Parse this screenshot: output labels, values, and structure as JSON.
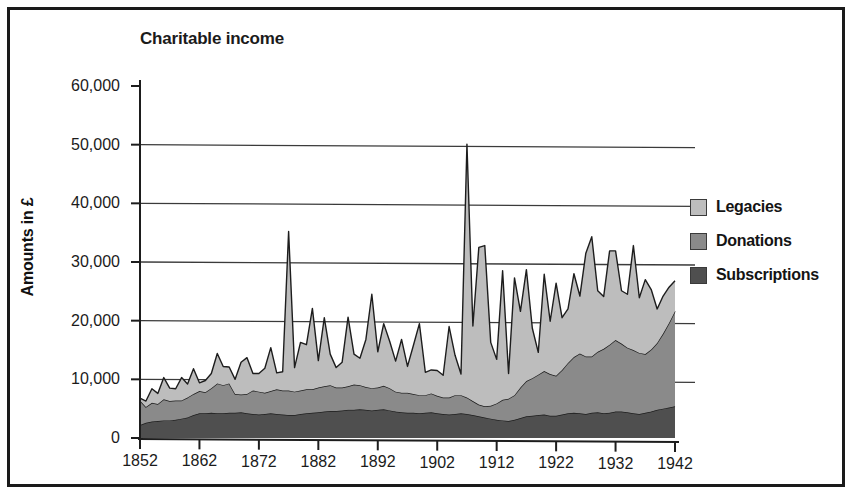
{
  "figure": {
    "title": "Charitable income",
    "frame_color": "#1a1a1a",
    "background": "#ffffff"
  },
  "legend": {
    "position": "right",
    "items": [
      {
        "label": "Legacies",
        "color": "#bdbdbd",
        "swatch_name": "legend-swatch-legacies"
      },
      {
        "label": "Donations",
        "color": "#8a8a8a",
        "swatch_name": "legend-swatch-donations"
      },
      {
        "label": "Subscriptions",
        "color": "#4f4f4f",
        "swatch_name": "legend-swatch-subscriptions"
      }
    ]
  },
  "chart_data": {
    "type": "area",
    "stacked": true,
    "title": "Charitable income",
    "xlabel": "",
    "ylabel": "Amounts in £",
    "xlim": [
      1852,
      1942
    ],
    "ylim": [
      0,
      60000
    ],
    "grid": true,
    "gridlines_y": [
      10000,
      20000,
      30000,
      40000,
      50000
    ],
    "ytick_labels": [
      "0",
      "10,000",
      "20,000",
      "30,000",
      "40,000",
      "50,000",
      "60,000"
    ],
    "ytick_values": [
      0,
      10000,
      20000,
      30000,
      40000,
      50000,
      60000
    ],
    "xtick_labels": [
      "1852",
      "1862",
      "1872",
      "1882",
      "1892",
      "1902",
      "1912",
      "1922",
      "1932",
      "1942"
    ],
    "xtick_values": [
      1852,
      1862,
      1872,
      1882,
      1892,
      1902,
      1912,
      1922,
      1932,
      1942
    ],
    "x": [
      1852,
      1853,
      1854,
      1855,
      1856,
      1857,
      1858,
      1859,
      1860,
      1861,
      1862,
      1863,
      1864,
      1865,
      1866,
      1867,
      1868,
      1869,
      1870,
      1871,
      1872,
      1873,
      1874,
      1875,
      1876,
      1877,
      1878,
      1879,
      1880,
      1881,
      1882,
      1883,
      1884,
      1885,
      1886,
      1887,
      1888,
      1889,
      1890,
      1891,
      1892,
      1893,
      1894,
      1895,
      1896,
      1897,
      1898,
      1899,
      1900,
      1901,
      1902,
      1903,
      1904,
      1905,
      1906,
      1907,
      1908,
      1909,
      1910,
      1911,
      1912,
      1913,
      1914,
      1915,
      1916,
      1917,
      1918,
      1919,
      1920,
      1921,
      1922,
      1923,
      1924,
      1925,
      1926,
      1927,
      1928,
      1929,
      1930,
      1931,
      1932,
      1933,
      1934,
      1935,
      1936,
      1937,
      1938,
      1939,
      1940,
      1941,
      1942
    ],
    "series": [
      {
        "name": "Subscriptions",
        "color": "#4f4f4f",
        "values": [
          2200,
          2600,
          2800,
          2900,
          3000,
          3000,
          3100,
          3300,
          3500,
          3900,
          4200,
          4200,
          4300,
          4200,
          4200,
          4300,
          4300,
          4400,
          4200,
          4100,
          4000,
          4100,
          4200,
          4100,
          4000,
          3900,
          3900,
          4100,
          4200,
          4300,
          4400,
          4500,
          4600,
          4600,
          4700,
          4800,
          4800,
          4900,
          4800,
          4700,
          4800,
          4900,
          4700,
          4500,
          4400,
          4300,
          4300,
          4200,
          4300,
          4400,
          4200,
          4100,
          4000,
          4100,
          4200,
          4100,
          3900,
          3700,
          3500,
          3300,
          3100,
          3000,
          2900,
          3100,
          3400,
          3700,
          3800,
          3900,
          4000,
          3800,
          3800,
          4000,
          4200,
          4300,
          4200,
          4100,
          4300,
          4400,
          4200,
          4300,
          4500,
          4500,
          4400,
          4200,
          4100,
          4300,
          4500,
          4800,
          5000,
          5200,
          5400
        ]
      },
      {
        "name": "Donations",
        "color": "#8a8a8a",
        "values": [
          4200,
          2700,
          3200,
          2900,
          3600,
          3300,
          3300,
          3100,
          3400,
          3600,
          3800,
          3600,
          4200,
          5100,
          4800,
          5000,
          3200,
          3000,
          3300,
          4000,
          3900,
          3600,
          3800,
          4200,
          4100,
          4200,
          4000,
          4000,
          4100,
          4000,
          4200,
          4300,
          4400,
          4000,
          3900,
          4000,
          4300,
          4100,
          3900,
          3800,
          3800,
          4000,
          3800,
          3400,
          3300,
          3400,
          3200,
          3100,
          3000,
          3200,
          3000,
          2800,
          2900,
          3200,
          3100,
          2800,
          2400,
          2000,
          1900,
          2200,
          2800,
          3500,
          3800,
          4200,
          5200,
          6000,
          6400,
          6900,
          7400,
          7100,
          6800,
          7600,
          8600,
          9500,
          10200,
          9800,
          9600,
          10300,
          11000,
          11600,
          12200,
          11600,
          11000,
          10800,
          10400,
          10000,
          10600,
          11400,
          12800,
          14400,
          16200
        ]
      },
      {
        "name": "Legacies",
        "color": "#bdbdbd",
        "values": [
          400,
          1000,
          2400,
          1800,
          3700,
          2200,
          2000,
          3900,
          2300,
          4300,
          1400,
          2000,
          2500,
          5100,
          3200,
          2800,
          2500,
          5500,
          6200,
          2900,
          3100,
          4200,
          7400,
          2800,
          3200,
          27100,
          4100,
          8200,
          7600,
          13800,
          4600,
          11700,
          5300,
          3400,
          4300,
          11800,
          5200,
          4600,
          8100,
          16000,
          6100,
          10600,
          8000,
          5200,
          9100,
          4500,
          8300,
          12200,
          3900,
          4000,
          4300,
          3800,
          12100,
          6800,
          3600,
          43200,
          12800,
          26800,
          27400,
          10800,
          7500,
          22000,
          4300,
          20000,
          13000,
          19000,
          8500,
          3800,
          16500,
          9000,
          15800,
          8900,
          9200,
          14200,
          9800,
          17600,
          20400,
          10400,
          8900,
          16000,
          15200,
          9000,
          9100,
          17800,
          9400,
          12700,
          10200,
          5800,
          6400,
          6100,
          5200
        ]
      }
    ]
  }
}
